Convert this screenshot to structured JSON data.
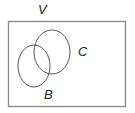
{
  "diagram": {
    "type": "venn",
    "universe": {
      "label": "V",
      "rect": {
        "x": 8,
        "y": 21,
        "width": 118,
        "height": 86
      }
    },
    "sets": [
      {
        "label": "C",
        "ellipse": {
          "cx": 52,
          "cy": 52,
          "rx": 18,
          "ry": 22
        }
      },
      {
        "label": "B",
        "ellipse": {
          "cx": 34,
          "cy": 66,
          "rx": 16,
          "ry": 21
        }
      }
    ],
    "colors": {
      "stroke": "#555555",
      "frame": "#888888",
      "text": "#222222",
      "background": "#ffffff"
    }
  }
}
